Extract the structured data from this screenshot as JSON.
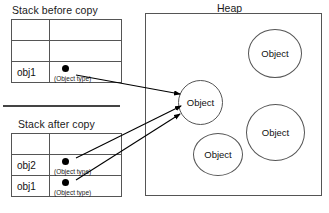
{
  "diagram": {
    "title_heap": "Heap",
    "stack_before": {
      "caption": "Stack before copy",
      "rows": [
        {
          "name": "",
          "type": ""
        },
        {
          "name": "",
          "type": ""
        },
        {
          "name": "obj1",
          "type": "(Object type)"
        }
      ]
    },
    "stack_after": {
      "caption": "Stack after copy",
      "rows": [
        {
          "name": "",
          "type": ""
        },
        {
          "name": "obj2",
          "type": "(Object type)"
        },
        {
          "name": "obj1",
          "type": "(Object type)"
        }
      ]
    },
    "heap": {
      "label": "Heap",
      "objects": [
        {
          "label": "Object"
        },
        {
          "label": "Object"
        },
        {
          "label": "Object"
        },
        {
          "label": "Object"
        }
      ]
    },
    "colors": {
      "stroke": "#555555",
      "text": "#111111",
      "dot": "#000000",
      "arrow": "#000000"
    }
  }
}
